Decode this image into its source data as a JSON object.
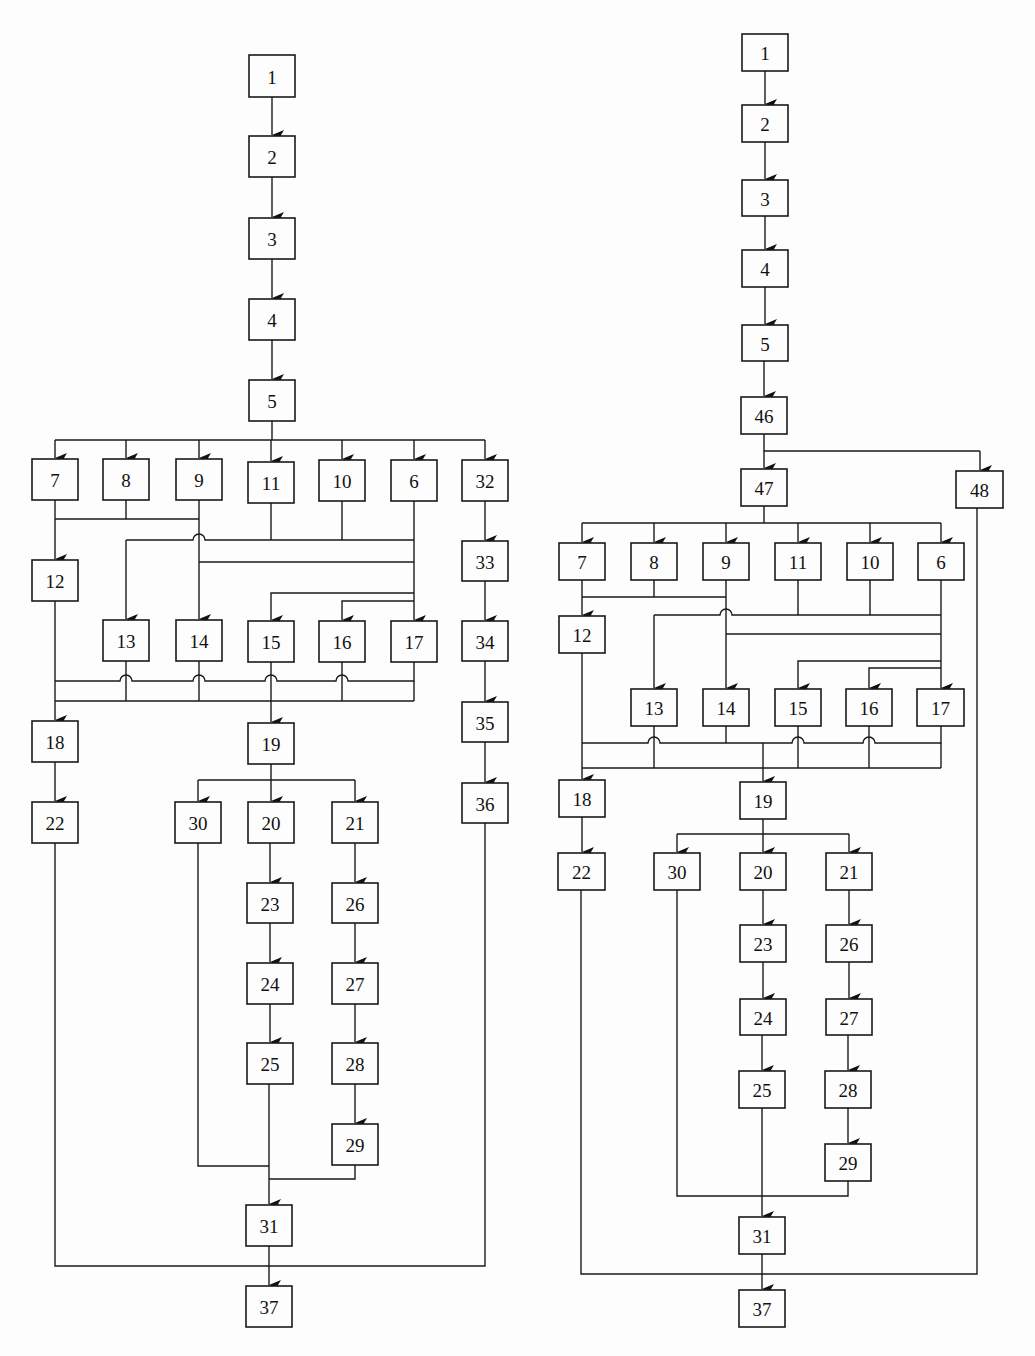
{
  "diagrams": [
    {
      "id": "left",
      "nodes": {
        "n1": {
          "label": "1",
          "x": 249,
          "y": 55,
          "w": 46,
          "h": 42
        },
        "n2": {
          "label": "2",
          "x": 249,
          "y": 136,
          "w": 46,
          "h": 41
        },
        "n3": {
          "label": "3",
          "x": 249,
          "y": 218,
          "w": 46,
          "h": 41
        },
        "n4": {
          "label": "4",
          "x": 249,
          "y": 299,
          "w": 46,
          "h": 41
        },
        "n5": {
          "label": "5",
          "x": 249,
          "y": 380,
          "w": 46,
          "h": 41
        },
        "n7": {
          "label": "7",
          "x": 32,
          "y": 459,
          "w": 46,
          "h": 41
        },
        "n8": {
          "label": "8",
          "x": 103,
          "y": 459,
          "w": 46,
          "h": 41
        },
        "n9": {
          "label": "9",
          "x": 176,
          "y": 459,
          "w": 46,
          "h": 41
        },
        "n11": {
          "label": "11",
          "x": 248,
          "y": 462,
          "w": 46,
          "h": 41
        },
        "n10": {
          "label": "10",
          "x": 319,
          "y": 460,
          "w": 46,
          "h": 41
        },
        "n6": {
          "label": "6",
          "x": 391,
          "y": 460,
          "w": 46,
          "h": 41
        },
        "n32": {
          "label": "32",
          "x": 462,
          "y": 460,
          "w": 46,
          "h": 41
        },
        "n12": {
          "label": "12",
          "x": 32,
          "y": 560,
          "w": 46,
          "h": 41
        },
        "n33": {
          "label": "33",
          "x": 462,
          "y": 541,
          "w": 46,
          "h": 40
        },
        "n13": {
          "label": "13",
          "x": 103,
          "y": 620,
          "w": 46,
          "h": 41
        },
        "n14": {
          "label": "14",
          "x": 176,
          "y": 620,
          "w": 46,
          "h": 41
        },
        "n15": {
          "label": "15",
          "x": 248,
          "y": 621,
          "w": 46,
          "h": 41
        },
        "n16": {
          "label": "16",
          "x": 319,
          "y": 621,
          "w": 46,
          "h": 41
        },
        "n17": {
          "label": "17",
          "x": 391,
          "y": 621,
          "w": 46,
          "h": 41
        },
        "n34": {
          "label": "34",
          "x": 462,
          "y": 621,
          "w": 46,
          "h": 40
        },
        "n35": {
          "label": "35",
          "x": 462,
          "y": 702,
          "w": 46,
          "h": 40
        },
        "n18": {
          "label": "18",
          "x": 32,
          "y": 721,
          "w": 46,
          "h": 41
        },
        "n19": {
          "label": "19",
          "x": 248,
          "y": 723,
          "w": 46,
          "h": 41
        },
        "n36": {
          "label": "36",
          "x": 462,
          "y": 783,
          "w": 46,
          "h": 40
        },
        "n22": {
          "label": "22",
          "x": 32,
          "y": 802,
          "w": 46,
          "h": 41
        },
        "n30": {
          "label": "30",
          "x": 175,
          "y": 802,
          "w": 46,
          "h": 41
        },
        "n20": {
          "label": "20",
          "x": 248,
          "y": 802,
          "w": 46,
          "h": 41
        },
        "n21": {
          "label": "21",
          "x": 332,
          "y": 802,
          "w": 46,
          "h": 41
        },
        "n23": {
          "label": "23",
          "x": 247,
          "y": 883,
          "w": 46,
          "h": 40
        },
        "n26": {
          "label": "26",
          "x": 332,
          "y": 883,
          "w": 46,
          "h": 40
        },
        "n24": {
          "label": "24",
          "x": 247,
          "y": 963,
          "w": 46,
          "h": 41
        },
        "n27": {
          "label": "27",
          "x": 332,
          "y": 963,
          "w": 46,
          "h": 41
        },
        "n25": {
          "label": "25",
          "x": 247,
          "y": 1043,
          "w": 46,
          "h": 41
        },
        "n28": {
          "label": "28",
          "x": 332,
          "y": 1043,
          "w": 46,
          "h": 41
        },
        "n29": {
          "label": "29",
          "x": 332,
          "y": 1124,
          "w": 46,
          "h": 41
        },
        "n31": {
          "label": "31",
          "x": 246,
          "y": 1205,
          "w": 46,
          "h": 41
        },
        "n37": {
          "label": "37",
          "x": 246,
          "y": 1286,
          "w": 46,
          "h": 41
        }
      }
    },
    {
      "id": "right",
      "nodes": {
        "n1": {
          "label": "1",
          "x": 742,
          "y": 34,
          "w": 46,
          "h": 37
        },
        "n2": {
          "label": "2",
          "x": 742,
          "y": 105,
          "w": 46,
          "h": 37
        },
        "n3": {
          "label": "3",
          "x": 742,
          "y": 180,
          "w": 46,
          "h": 36
        },
        "n4": {
          "label": "4",
          "x": 742,
          "y": 250,
          "w": 46,
          "h": 37
        },
        "n5": {
          "label": "5",
          "x": 742,
          "y": 325,
          "w": 46,
          "h": 36
        },
        "n46": {
          "label": "46",
          "x": 741,
          "y": 397,
          "w": 46,
          "h": 37
        },
        "n47": {
          "label": "47",
          "x": 741,
          "y": 469,
          "w": 46,
          "h": 37
        },
        "n48": {
          "label": "48",
          "x": 956,
          "y": 471,
          "w": 47,
          "h": 37
        },
        "n7": {
          "label": "7",
          "x": 559,
          "y": 543,
          "w": 46,
          "h": 37
        },
        "n8": {
          "label": "8",
          "x": 631,
          "y": 543,
          "w": 46,
          "h": 37
        },
        "n9": {
          "label": "9",
          "x": 703,
          "y": 543,
          "w": 46,
          "h": 37
        },
        "n11": {
          "label": "11",
          "x": 775,
          "y": 543,
          "w": 46,
          "h": 37
        },
        "n10": {
          "label": "10",
          "x": 847,
          "y": 543,
          "w": 46,
          "h": 37
        },
        "n6": {
          "label": "6",
          "x": 918,
          "y": 543,
          "w": 46,
          "h": 37
        },
        "n12": {
          "label": "12",
          "x": 559,
          "y": 616,
          "w": 46,
          "h": 37
        },
        "n13": {
          "label": "13",
          "x": 631,
          "y": 689,
          "w": 46,
          "h": 37
        },
        "n14": {
          "label": "14",
          "x": 703,
          "y": 689,
          "w": 46,
          "h": 37
        },
        "n15": {
          "label": "15",
          "x": 775,
          "y": 689,
          "w": 46,
          "h": 37
        },
        "n16": {
          "label": "16",
          "x": 846,
          "y": 689,
          "w": 46,
          "h": 37
        },
        "n17": {
          "label": "17",
          "x": 917,
          "y": 689,
          "w": 47,
          "h": 37
        },
        "n18": {
          "label": "18",
          "x": 559,
          "y": 780,
          "w": 46,
          "h": 37
        },
        "n19": {
          "label": "19",
          "x": 740,
          "y": 782,
          "w": 46,
          "h": 37
        },
        "n22": {
          "label": "22",
          "x": 558,
          "y": 853,
          "w": 47,
          "h": 37
        },
        "n30": {
          "label": "30",
          "x": 654,
          "y": 853,
          "w": 46,
          "h": 37
        },
        "n20": {
          "label": "20",
          "x": 740,
          "y": 853,
          "w": 46,
          "h": 37
        },
        "n21": {
          "label": "21",
          "x": 826,
          "y": 853,
          "w": 46,
          "h": 37
        },
        "n23": {
          "label": "23",
          "x": 740,
          "y": 925,
          "w": 46,
          "h": 37
        },
        "n26": {
          "label": "26",
          "x": 826,
          "y": 925,
          "w": 46,
          "h": 37
        },
        "n24": {
          "label": "24",
          "x": 740,
          "y": 999,
          "w": 46,
          "h": 36
        },
        "n27": {
          "label": "27",
          "x": 826,
          "y": 999,
          "w": 46,
          "h": 36
        },
        "n25": {
          "label": "25",
          "x": 739,
          "y": 1071,
          "w": 46,
          "h": 37
        },
        "n28": {
          "label": "28",
          "x": 825,
          "y": 1071,
          "w": 46,
          "h": 37
        },
        "n29": {
          "label": "29",
          "x": 825,
          "y": 1144,
          "w": 46,
          "h": 37
        },
        "n31": {
          "label": "31",
          "x": 739,
          "y": 1217,
          "w": 46,
          "h": 37
        },
        "n37": {
          "label": "37",
          "x": 739,
          "y": 1290,
          "w": 46,
          "h": 37
        }
      }
    }
  ]
}
